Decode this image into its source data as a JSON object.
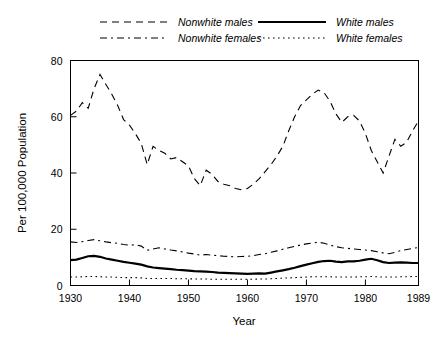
{
  "chart_data": {
    "type": "line",
    "title": "",
    "xlabel": "Year",
    "ylabel": "Per 100,000 Population",
    "xlim": [
      1930,
      1989
    ],
    "ylim": [
      0,
      80
    ],
    "xticks": [
      1930,
      1940,
      1950,
      1960,
      1970,
      1980,
      1989
    ],
    "xtick_labels": [
      "1930",
      "1940",
      "1950",
      "1960",
      "1970",
      "1980",
      "1989"
    ],
    "yticks": [
      0,
      20,
      40,
      60,
      80
    ],
    "ytick_labels": [
      "0",
      "20",
      "40",
      "60",
      "80"
    ],
    "grid": false,
    "legend_position": "above-plot",
    "x": [
      1930,
      1931,
      1932,
      1933,
      1934,
      1935,
      1936,
      1937,
      1938,
      1939,
      1940,
      1941,
      1942,
      1943,
      1944,
      1945,
      1946,
      1947,
      1948,
      1949,
      1950,
      1951,
      1952,
      1953,
      1954,
      1955,
      1956,
      1957,
      1958,
      1959,
      1960,
      1961,
      1962,
      1963,
      1964,
      1965,
      1966,
      1967,
      1968,
      1969,
      1970,
      1971,
      1972,
      1973,
      1974,
      1975,
      1976,
      1977,
      1978,
      1979,
      1980,
      1981,
      1982,
      1983,
      1984,
      1985,
      1986,
      1987,
      1988,
      1989
    ],
    "series": [
      {
        "name": "Nonwhite males",
        "linestyle": "dashed",
        "values": [
          60.5,
          62.0,
          65.0,
          63.0,
          70.0,
          75.0,
          71.5,
          68.0,
          64.0,
          59.0,
          57.0,
          54.0,
          50.5,
          43.0,
          49.5,
          48.0,
          47.0,
          45.0,
          45.5,
          44.0,
          42.5,
          38.0,
          35.5,
          41.0,
          39.5,
          37.0,
          36.0,
          35.5,
          34.5,
          34.0,
          34.5,
          36.0,
          38.0,
          40.5,
          43.0,
          46.0,
          49.5,
          55.0,
          60.0,
          64.0,
          66.0,
          68.0,
          69.5,
          68.5,
          65.5,
          61.0,
          58.0,
          60.0,
          60.5,
          58.5,
          54.0,
          48.0,
          44.0,
          40.0,
          46.0,
          52.0,
          49.5,
          51.0,
          55.0,
          58.5
        ]
      },
      {
        "name": "White males",
        "linestyle": "solid",
        "values": [
          9.0,
          9.2,
          9.8,
          10.4,
          10.5,
          10.2,
          9.6,
          9.2,
          8.8,
          8.4,
          8.1,
          7.8,
          7.4,
          6.8,
          6.4,
          6.2,
          6.0,
          5.8,
          5.6,
          5.5,
          5.3,
          5.1,
          5.0,
          4.9,
          4.8,
          4.6,
          4.5,
          4.4,
          4.3,
          4.2,
          4.1,
          4.2,
          4.3,
          4.2,
          4.6,
          5.0,
          5.4,
          5.8,
          6.3,
          6.9,
          7.4,
          7.9,
          8.4,
          8.7,
          8.8,
          8.5,
          8.3,
          8.6,
          8.6,
          8.8,
          9.2,
          9.5,
          9.0,
          8.3,
          8.0,
          8.1,
          8.2,
          8.1,
          8.0,
          8.0
        ]
      },
      {
        "name": "Nonwhite females",
        "linestyle": "dashdot",
        "values": [
          15.5,
          15.3,
          15.6,
          16.0,
          16.3,
          15.9,
          15.5,
          15.2,
          15.0,
          14.6,
          14.3,
          14.5,
          14.0,
          12.5,
          13.0,
          13.4,
          13.0,
          12.6,
          12.3,
          11.9,
          11.5,
          11.2,
          10.8,
          11.0,
          10.8,
          10.6,
          10.4,
          10.3,
          10.2,
          10.3,
          10.4,
          10.6,
          11.0,
          11.3,
          11.8,
          12.3,
          12.9,
          13.4,
          13.9,
          14.4,
          14.8,
          15.1,
          15.4,
          15.0,
          14.4,
          13.8,
          13.4,
          13.2,
          13.0,
          12.8,
          12.6,
          12.4,
          12.0,
          11.6,
          11.3,
          11.8,
          12.4,
          12.8,
          13.2,
          13.5
        ]
      },
      {
        "name": "White females",
        "linestyle": "dotted",
        "values": [
          3.0,
          3.0,
          3.1,
          3.2,
          3.2,
          3.1,
          3.0,
          3.0,
          2.9,
          2.8,
          2.8,
          2.8,
          2.7,
          2.5,
          2.5,
          2.5,
          2.5,
          2.5,
          2.4,
          2.4,
          2.4,
          2.3,
          2.3,
          2.3,
          2.2,
          2.2,
          2.2,
          2.2,
          2.2,
          2.2,
          2.2,
          2.2,
          2.3,
          2.3,
          2.4,
          2.5,
          2.6,
          2.7,
          2.8,
          2.9,
          3.0,
          3.1,
          3.1,
          3.1,
          3.1,
          3.0,
          3.0,
          3.0,
          3.0,
          3.1,
          3.1,
          3.2,
          3.1,
          3.0,
          3.0,
          3.0,
          3.1,
          3.1,
          3.2,
          3.2
        ]
      }
    ]
  },
  "legend": {
    "entries": [
      {
        "label": "Nonwhite males",
        "style": "dashed"
      },
      {
        "label": "White males",
        "style": "solid"
      },
      {
        "label": "Nonwhite females",
        "style": "dashdot"
      },
      {
        "label": "White females",
        "style": "dotted"
      }
    ]
  },
  "colors": {
    "line": "#000000",
    "axis": "#000000",
    "background": "#ffffff"
  }
}
